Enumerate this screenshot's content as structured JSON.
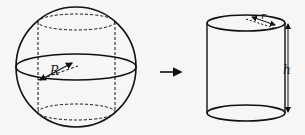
{
  "diagram": {
    "sphere": {
      "radius_label": "R"
    },
    "arrow": {
      "direction": "right"
    },
    "cylinder": {
      "radius_label": "r",
      "height_label": "h"
    },
    "colors": {
      "stroke": "#111111",
      "background": "#f6f6f6"
    }
  }
}
